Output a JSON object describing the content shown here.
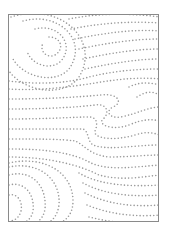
{
  "image": {
    "subject": "dotted wood grain pattern",
    "frame": {
      "x": 8,
      "y": 14,
      "width": 151,
      "height": 208,
      "border_color": "#8a8a8a"
    },
    "dot_color": "#9a9a9a",
    "background": "#ffffff"
  }
}
